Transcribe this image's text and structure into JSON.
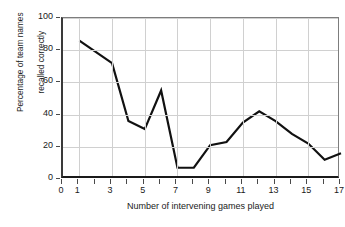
{
  "chart_data": {
    "type": "line",
    "title": "",
    "xlabel": "Number of intervening games played",
    "ylabel_line1": "Percentage of team names",
    "ylabel_line2": "recalled correctly",
    "x": [
      1,
      2,
      3,
      4,
      5,
      6,
      7,
      8,
      9,
      10,
      11,
      12,
      13,
      14,
      15,
      16,
      17
    ],
    "values": [
      86,
      79,
      72,
      36,
      31,
      55,
      7,
      7,
      21,
      23,
      35,
      42,
      36,
      28,
      22,
      12,
      16
    ],
    "series": [
      {
        "name": "Percentage of team names recalled correctly",
        "values": [
          86,
          79,
          72,
          36,
          31,
          55,
          7,
          7,
          21,
          23,
          35,
          42,
          36,
          28,
          22,
          12,
          16
        ]
      }
    ],
    "xlim": [
      0,
      17
    ],
    "ylim": [
      0,
      100
    ],
    "xticks": [
      0,
      1,
      2,
      3,
      4,
      5,
      6,
      7,
      8,
      9,
      10,
      11,
      12,
      13,
      14,
      15,
      16,
      17
    ],
    "xtick_labels": [
      "0",
      "1",
      "",
      "3",
      "",
      "5",
      "",
      "7",
      "",
      "9",
      "",
      "11",
      "",
      "13",
      "",
      "15",
      "",
      "17"
    ],
    "yticks": [
      0,
      20,
      40,
      60,
      80,
      100
    ],
    "ytick_labels": [
      "0",
      "20",
      "40",
      "60",
      "80",
      "100"
    ],
    "grid": true,
    "legend": "none",
    "line_color": "#111111",
    "grid_color": "#d0d0d0",
    "axis_color": "#1a1a1a",
    "background": "#ffffff"
  }
}
